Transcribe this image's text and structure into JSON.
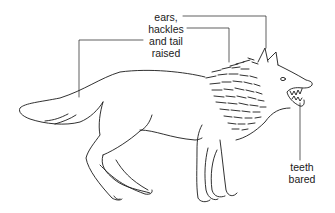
{
  "figure": {
    "labels": {
      "main": {
        "lines": [
          "ears,",
          "hackles",
          "and tail",
          "raised"
        ]
      },
      "teeth": {
        "lines": [
          "teeth",
          "bared"
        ]
      }
    },
    "colors": {
      "line": "#1a1a1a",
      "background": "#ffffff"
    }
  }
}
